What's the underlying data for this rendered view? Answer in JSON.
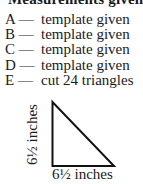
{
  "heading": "Measurements given",
  "items": [
    {
      "letter": "A —",
      "text": "template given"
    },
    {
      "letter": "B —",
      "text": "template given"
    },
    {
      "letter": "C —",
      "text": "template given"
    },
    {
      "letter": "D —",
      "text": "template given"
    },
    {
      "letter": "E —",
      "text": "cut 24 triangles"
    }
  ],
  "triangle": {
    "height_label": "6½ inches",
    "base_label": "6½ inches",
    "stroke_color": "#111111"
  }
}
